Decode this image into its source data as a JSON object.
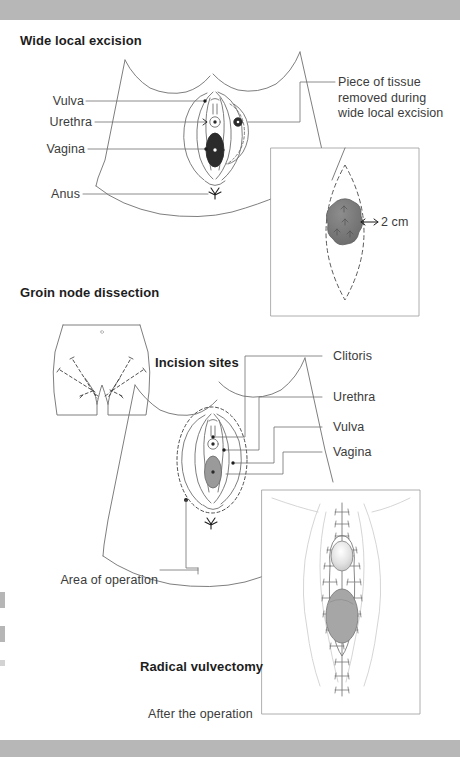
{
  "page": {
    "width": 460,
    "height": 757,
    "background": "#ffffff",
    "scan_bar_color": "#b7b7b7",
    "line_color": "#6f6f6f",
    "text_color": "#3b3b3b",
    "heading_color": "#1d1d1d",
    "tumour_fill": "#6e6e6e",
    "vagina_fill": "#2b2b2b",
    "tissue_fill": "#9a9a9a"
  },
  "sections": [
    {
      "id": "wide-local-excision",
      "heading": "Wide local excision",
      "left_labels": [
        "Vulva",
        "Urethra",
        "Vagina",
        "Anus"
      ],
      "callout": "Piece of tissue removed during wide local excision",
      "inset_label": "2 cm"
    },
    {
      "id": "groin-node-dissection",
      "heading": "Groin node dissection",
      "incision_label": "Incision sites",
      "right_labels": [
        "Clitoris",
        "Urethra",
        "Vulva",
        "Vagina"
      ],
      "area_label": "Area of operation"
    },
    {
      "id": "radical-vulvectomy",
      "heading": "Radical vulvectomy",
      "caption": "After the operation"
    }
  ],
  "labels": {
    "wide_local_excision": "Wide local excision",
    "vulva_1": "Vulva",
    "urethra_1": "Urethra",
    "vagina_1": "Vagina",
    "anus": "Anus",
    "piece_of_tissue": "Piece of tissue\nremoved during\nwide local excision",
    "two_cm": "2 cm",
    "groin_node_dissection": "Groin node dissection",
    "incision_sites": "Incision sites",
    "clitoris": "Clitoris",
    "urethra_2": "Urethra",
    "vulva_2": "Vulva",
    "vagina_2": "Vagina",
    "area_of_operation": "Area of operation",
    "radical_vulvectomy": "Radical vulvectomy",
    "after_the_operation": "After the operation"
  }
}
